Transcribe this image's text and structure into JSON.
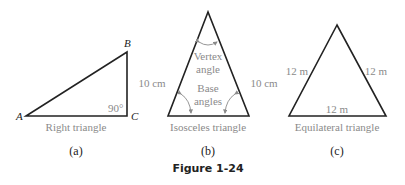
{
  "figure_title": "Figure 1-24",
  "panels": [
    {
      "id": "a",
      "caption": "(a)",
      "name": "Right triangle",
      "vertices": {
        "A": "A",
        "B": "B",
        "C": "C"
      },
      "angle_label": "90°"
    },
    {
      "id": "b",
      "caption": "(b)",
      "name": "Isosceles triangle",
      "left_side": "10 cm",
      "right_side": "10 cm",
      "vertex_label_line1": "Vertex",
      "vertex_label_line2": "angle",
      "base_label_line1": "Base",
      "base_label_line2": "angles"
    },
    {
      "id": "c",
      "caption": "(c)",
      "name": "Equilateral triangle",
      "left_side": "12 m",
      "right_side": "12 m",
      "base_side": "12 m"
    }
  ],
  "colors": {
    "line": "#222222",
    "annotation": "#8a8a8a"
  }
}
